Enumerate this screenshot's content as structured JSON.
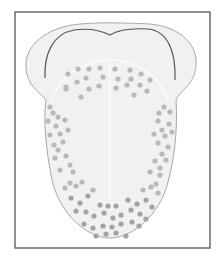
{
  "figure": {
    "colors": {
      "frame": "#555555",
      "tongue_fill": "#f1f1f1",
      "tongue_outline": "#a8a8a8",
      "fold_line": "#555555",
      "midline": "#ffffff",
      "dot": "#b9b9b9",
      "dot_dark": "#a3a3a3"
    },
    "frame": {
      "x": 15,
      "y": 12,
      "w": 195,
      "h": 236
    },
    "dots": [
      [
        68,
        74
      ],
      [
        78,
        69
      ],
      [
        89,
        69
      ],
      [
        100,
        68
      ],
      [
        115,
        69
      ],
      [
        130,
        70
      ],
      [
        141,
        74
      ],
      [
        66,
        87
      ],
      [
        77,
        82
      ],
      [
        86,
        78
      ],
      [
        103,
        77
      ],
      [
        118,
        79
      ],
      [
        131,
        79
      ],
      [
        150,
        80
      ],
      [
        66,
        89
      ],
      [
        89,
        89
      ],
      [
        99,
        86
      ],
      [
        116,
        88
      ],
      [
        127,
        85
      ],
      [
        140,
        85
      ],
      [
        81,
        97
      ],
      [
        134,
        95
      ],
      [
        147,
        91
      ],
      [
        50,
        107
      ],
      [
        53,
        113
      ],
      [
        58,
        117
      ],
      [
        164,
        107
      ],
      [
        170,
        112
      ],
      [
        159,
        113
      ],
      [
        48,
        121
      ],
      [
        56,
        126
      ],
      [
        65,
        120
      ],
      [
        158,
        121
      ],
      [
        169,
        124
      ],
      [
        162,
        130
      ],
      [
        50,
        135
      ],
      [
        60,
        134
      ],
      [
        68,
        130
      ],
      [
        154,
        134
      ],
      [
        165,
        136
      ],
      [
        172,
        132
      ],
      [
        54,
        145
      ],
      [
        63,
        142
      ],
      [
        58,
        150
      ],
      [
        158,
        143
      ],
      [
        168,
        147
      ],
      [
        162,
        154
      ],
      [
        55,
        158
      ],
      [
        66,
        156
      ],
      [
        70,
        165
      ],
      [
        155,
        161
      ],
      [
        166,
        160
      ],
      [
        160,
        168
      ],
      [
        60,
        170
      ],
      [
        73,
        172
      ],
      [
        70,
        183
      ],
      [
        150,
        172
      ],
      [
        160,
        175
      ],
      [
        156,
        184
      ],
      [
        65,
        188
      ],
      [
        76,
        186
      ],
      [
        82,
        182
      ],
      [
        93,
        190
      ],
      [
        143,
        190
      ],
      [
        151,
        187
      ],
      [
        158,
        193
      ],
      [
        71,
        198
      ],
      [
        80,
        203
      ],
      [
        88,
        196
      ],
      [
        100,
        205
      ],
      [
        108,
        206
      ],
      [
        116,
        206
      ],
      [
        128,
        200
      ],
      [
        137,
        204
      ],
      [
        146,
        200
      ],
      [
        152,
        207
      ],
      [
        76,
        211
      ],
      [
        86,
        212
      ],
      [
        94,
        216
      ],
      [
        104,
        213
      ],
      [
        113,
        218
      ],
      [
        121,
        215
      ],
      [
        131,
        210
      ],
      [
        140,
        214
      ],
      [
        146,
        219
      ],
      [
        84,
        224
      ],
      [
        93,
        228
      ],
      [
        103,
        226
      ],
      [
        112,
        227
      ],
      [
        121,
        224
      ],
      [
        132,
        222
      ],
      [
        139,
        226
      ],
      [
        96,
        236
      ],
      [
        106,
        234
      ],
      [
        116,
        233
      ],
      [
        126,
        236
      ]
    ]
  }
}
